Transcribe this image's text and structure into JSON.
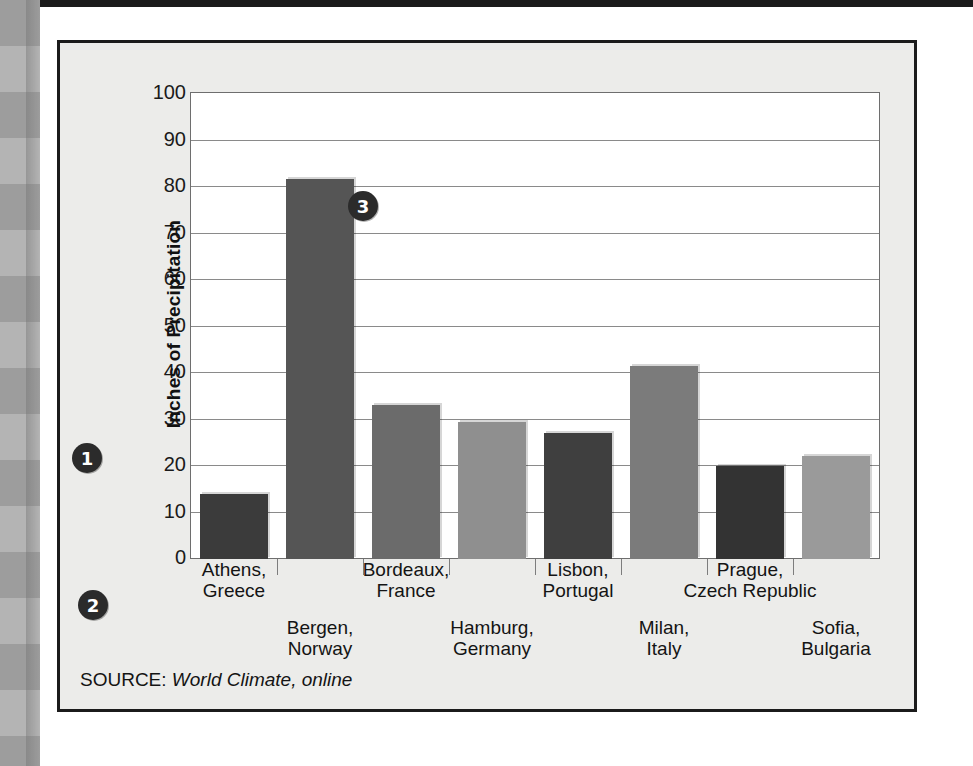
{
  "figure": {
    "source_prefix": "SOURCE:",
    "source_text": "World Climate, online"
  },
  "callouts": [
    {
      "name": "y-axis-callout",
      "label": "1"
    },
    {
      "name": "x-axis-callout",
      "label": "2"
    },
    {
      "name": "bars-callout",
      "label": "3"
    }
  ],
  "colors": {
    "page_background": "#ffffff",
    "figure_background": "#ececea",
    "figure_border": "#1b1b1b",
    "plot_background": "#ffffff",
    "gridline": "#8a8a8a",
    "text": "#141414",
    "callout_fill": "#2b2b2b",
    "callout_text": "#ffffff"
  },
  "chart_data": {
    "type": "bar",
    "title": "",
    "xlabel": "",
    "ylabel": "Inches of Precipitation",
    "ylim": [
      0,
      100
    ],
    "ytick_step": 10,
    "grid": true,
    "legend": "none",
    "ytick_labels": [
      "100",
      "90",
      "80",
      "70",
      "60",
      "50",
      "40",
      "30",
      "20",
      "10",
      "0"
    ],
    "categories": [
      "Athens,\nGreece",
      "Bergen,\nNorway",
      "Bordeaux,\nFrance",
      "Hamburg,\nGermany",
      "Lisbon,\nPortugal",
      "Milan,\nItaly",
      "Prague,\nCzech Republic",
      "Sofia,\nBulgaria"
    ],
    "category_lines": [
      {
        "line1": "Athens,",
        "line2": "Greece"
      },
      {
        "line1": "Bergen,",
        "line2": "Norway"
      },
      {
        "line1": "Bordeaux,",
        "line2": "France"
      },
      {
        "line1": "Hamburg,",
        "line2": "Germany"
      },
      {
        "line1": "Lisbon,",
        "line2": "Portugal"
      },
      {
        "line1": "Milan,",
        "line2": "Italy"
      },
      {
        "line1": "Prague,",
        "line2": "Czech Republic"
      },
      {
        "line1": "Sofia,",
        "line2": "Bulgaria"
      }
    ],
    "values": [
      14,
      81.5,
      33,
      29.5,
      27,
      41.5,
      20,
      22
    ],
    "bar_colors": [
      "#3b3b3b",
      "#555555",
      "#6b6b6b",
      "#8f8f8f",
      "#3f3f3f",
      "#7b7b7b",
      "#333333",
      "#9a9a9a"
    ]
  }
}
